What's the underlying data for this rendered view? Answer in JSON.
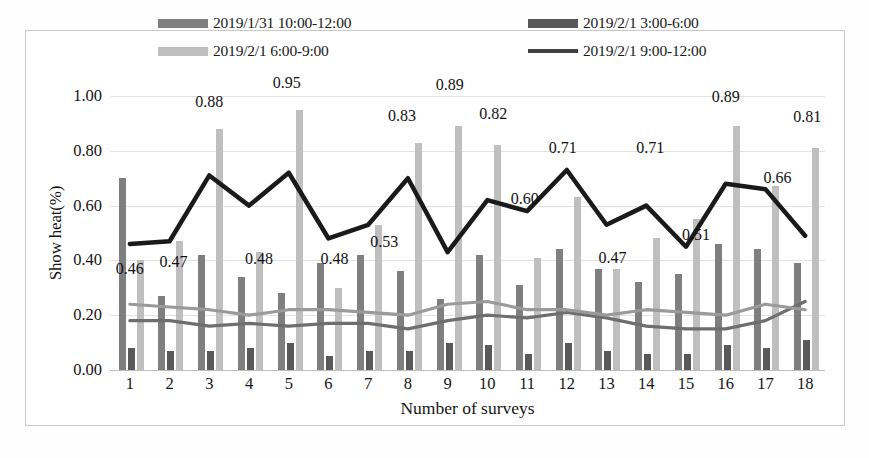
{
  "legend": {
    "items": [
      {
        "label": "2019/1/31 10:00-12:00",
        "color": "#7f7f7f",
        "marker": "bar"
      },
      {
        "label": "2019/2/1 3:00-6:00",
        "color": "#595959",
        "marker": "bar"
      },
      {
        "label": "2019/2/1 6:00-9:00",
        "color": "#bfbfbf",
        "marker": "bar"
      },
      {
        "label": "2019/2/1 9:00-12:00",
        "color": "#404040",
        "marker": "line"
      }
    ]
  },
  "chart_data": {
    "type": "bar",
    "title": "",
    "xlabel": "Number of surveys",
    "ylabel": "Show heat(%)",
    "categories": [
      "1",
      "2",
      "3",
      "4",
      "5",
      "6",
      "7",
      "8",
      "9",
      "10",
      "11",
      "12",
      "13",
      "14",
      "15",
      "16",
      "17",
      "18"
    ],
    "ylim": [
      0.0,
      1.0
    ],
    "yticks": [
      "0.00",
      "0.20",
      "0.40",
      "0.60",
      "0.80",
      "1.00"
    ],
    "ytick_values": [
      0.0,
      0.2,
      0.4,
      0.6,
      0.8,
      1.0
    ],
    "grid": true,
    "legend_position": "top",
    "series": [
      {
        "name": "2019/1/31 10:00-12:00",
        "type": "bar",
        "color": "#7f7f7f",
        "values": [
          0.7,
          0.27,
          0.42,
          0.34,
          0.28,
          0.39,
          0.42,
          0.36,
          0.26,
          0.42,
          0.31,
          0.44,
          0.37,
          0.32,
          0.35,
          0.46,
          0.44,
          0.39
        ]
      },
      {
        "name": "2019/2/1 6:00-9:00",
        "type": "bar",
        "color": "#bfbfbf",
        "values": [
          0.4,
          0.47,
          0.88,
          0.43,
          0.95,
          0.3,
          0.53,
          0.83,
          0.89,
          0.82,
          0.41,
          0.63,
          0.37,
          0.48,
          0.55,
          0.89,
          0.67,
          0.81
        ]
      },
      {
        "name": "2019/2/1 3:00-6:00",
        "type": "bar",
        "color": "#595959",
        "values": [
          0.08,
          0.07,
          0.07,
          0.08,
          0.1,
          0.05,
          0.07,
          0.07,
          0.1,
          0.09,
          0.06,
          0.1,
          0.07,
          0.06,
          0.06,
          0.09,
          0.08,
          0.11
        ]
      },
      {
        "name": "2019/2/1 9:00-12:00",
        "type": "line",
        "color": "#1a1a1a",
        "values": [
          0.46,
          0.47,
          0.71,
          0.6,
          0.72,
          0.48,
          0.53,
          0.7,
          0.43,
          0.62,
          0.58,
          0.73,
          0.53,
          0.6,
          0.45,
          0.68,
          0.66,
          0.49
        ]
      },
      {
        "name": "gray-line-upper",
        "type": "line",
        "color": "#9a9a9a",
        "values": [
          0.24,
          0.23,
          0.22,
          0.2,
          0.22,
          0.22,
          0.21,
          0.2,
          0.24,
          0.25,
          0.22,
          0.22,
          0.2,
          0.22,
          0.21,
          0.2,
          0.24,
          0.22
        ]
      },
      {
        "name": "gray-line-lower",
        "type": "line",
        "color": "#6e6e6e",
        "values": [
          0.18,
          0.18,
          0.16,
          0.17,
          0.16,
          0.17,
          0.17,
          0.15,
          0.18,
          0.2,
          0.19,
          0.21,
          0.19,
          0.16,
          0.15,
          0.15,
          0.18,
          0.25
        ]
      }
    ],
    "data_labels": [
      {
        "category": "1",
        "value": 0.46,
        "text": "0.46"
      },
      {
        "category": "2",
        "value": 0.47,
        "text": "0.47"
      },
      {
        "category": "3",
        "value": 0.88,
        "text": "0.88"
      },
      {
        "category": "4",
        "value": 0.48,
        "text": "0.48"
      },
      {
        "category": "5",
        "value": 0.95,
        "text": "0.95"
      },
      {
        "category": "6",
        "value": 0.48,
        "text": "0.48"
      },
      {
        "category": "7",
        "value": 0.53,
        "text": "0.53"
      },
      {
        "category": "8",
        "value": 0.83,
        "text": "0.83"
      },
      {
        "category": "9",
        "value": 0.89,
        "text": "0.89"
      },
      {
        "category": "10",
        "value": 0.82,
        "text": "0.82"
      },
      {
        "category": "12",
        "value": 0.6,
        "text": "0.60"
      },
      {
        "category": "12",
        "value": 0.71,
        "text": "0.71"
      },
      {
        "category": "13",
        "value": 0.47,
        "text": "0.47"
      },
      {
        "category": "14",
        "value": 0.71,
        "text": "0.71"
      },
      {
        "category": "15",
        "value": 0.51,
        "text": "0.51"
      },
      {
        "category": "16",
        "value": 0.89,
        "text": "0.89"
      },
      {
        "category": "17",
        "value": 0.66,
        "text": "0.66"
      },
      {
        "category": "18",
        "value": 0.81,
        "text": "0.81"
      }
    ]
  }
}
